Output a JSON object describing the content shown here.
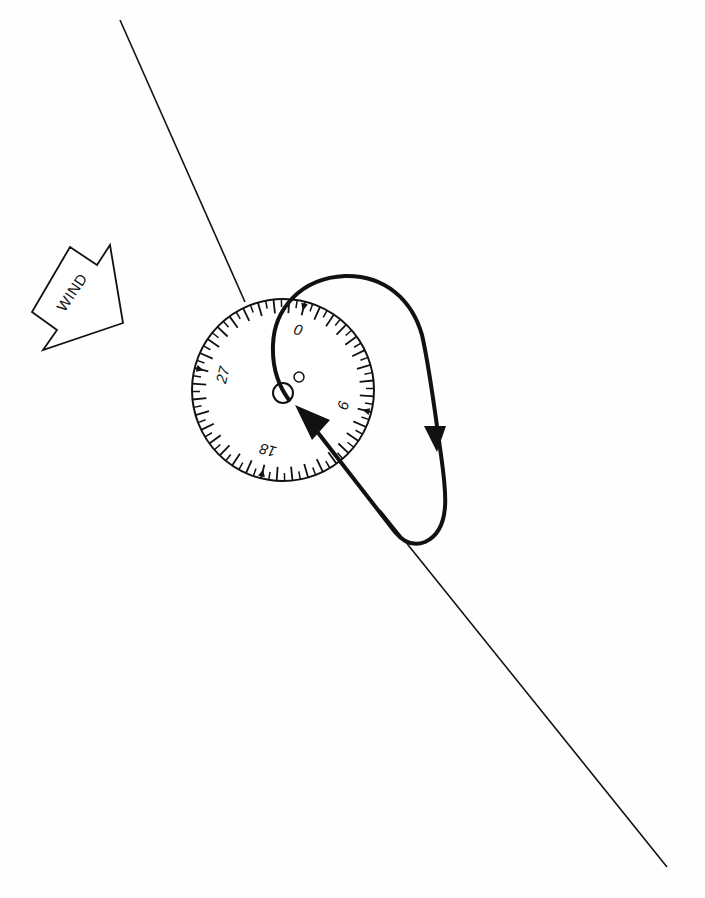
{
  "diagram": {
    "type": "holding-pattern-entry",
    "colors": {
      "ink": "#111111",
      "background": "#fefefe"
    },
    "wind_arrow": {
      "label": "WIND",
      "icon": "wind-arrow-icon"
    },
    "course_line": {
      "description": "inbound course line through station"
    },
    "compass_dial": {
      "labels": [
        {
          "text": "0",
          "angle_deg": 0
        },
        {
          "text": "9",
          "angle_deg": 90
        },
        {
          "text": "18",
          "angle_deg": 180
        },
        {
          "text": "27",
          "angle_deg": 270
        }
      ],
      "rotation_deg": 14,
      "tick_count": 36
    },
    "station": {
      "icon": "aircraft-station-circle-icon"
    },
    "flight_path": {
      "description": "teardrop/holding loop with direction arrows",
      "arrows": [
        "outbound-down-arrow",
        "inbound-arrow-to-station"
      ]
    }
  }
}
